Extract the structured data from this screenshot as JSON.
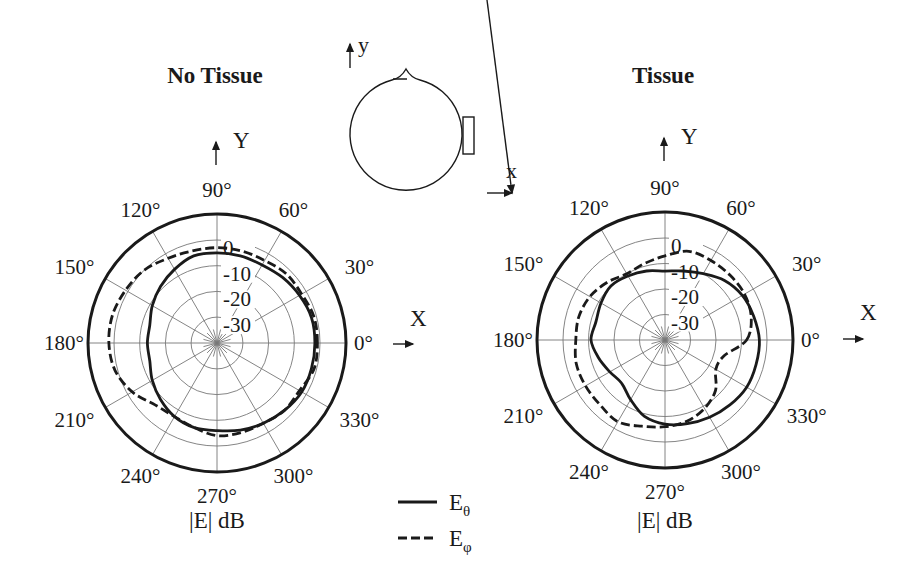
{
  "figure": {
    "head_diagram": {
      "y_axis_label": "y",
      "x_axis_label": "x"
    },
    "legend": [
      {
        "label": "E",
        "subscript": "θ",
        "style": "solid"
      },
      {
        "label": "E",
        "subscript": "φ",
        "style": "dashed"
      }
    ]
  },
  "chart_data": [
    {
      "type": "polar",
      "title": "No Tissue",
      "axis_x_label": "X",
      "axis_y_label": "Y",
      "radial_label": "|E| dB",
      "angle_ticks": [
        "0°",
        "30°",
        "60°",
        "90°",
        "120°",
        "150°",
        "180°",
        "210°",
        "240°",
        "270°",
        "300°",
        "330°"
      ],
      "radial_ticks": [
        "0",
        "-10",
        "-20",
        "-30"
      ],
      "radial_range_db": [
        -40,
        10
      ],
      "angles_deg": [
        0,
        15,
        30,
        45,
        60,
        75,
        90,
        105,
        120,
        135,
        150,
        165,
        180,
        195,
        210,
        225,
        240,
        255,
        270,
        285,
        300,
        315,
        330,
        345
      ],
      "series": [
        {
          "name": "Eθ",
          "style": "solid",
          "values_db": [
            -2,
            -2,
            -3,
            -4,
            -5,
            -5,
            -5,
            -5,
            -7,
            -9,
            -11,
            -13,
            -13,
            -13,
            -11,
            -9,
            -7,
            -6,
            -6,
            -5,
            -4,
            -3,
            -2,
            -2
          ]
        },
        {
          "name": "Eφ",
          "style": "dashed",
          "values_db": [
            -1,
            -1,
            -2,
            -2,
            -3,
            -3,
            -3,
            -3,
            -2,
            0,
            1,
            2,
            2,
            1,
            -2,
            -6,
            -7,
            -6,
            -4,
            -4,
            -4,
            -3,
            -3,
            -1
          ]
        }
      ]
    },
    {
      "type": "polar",
      "title": "Tissue",
      "axis_x_label": "X",
      "axis_y_label": "Y",
      "radial_label": "|E| dB",
      "angle_ticks": [
        "0°",
        "30°",
        "60°",
        "90°",
        "120°",
        "150°",
        "180°",
        "210°",
        "240°",
        "270°",
        "300°",
        "330°"
      ],
      "radial_ticks": [
        "0",
        "-10",
        "-20",
        "-30"
      ],
      "radial_range_db": [
        -40,
        10
      ],
      "angles_deg": [
        0,
        15,
        30,
        45,
        60,
        75,
        90,
        105,
        120,
        135,
        150,
        165,
        180,
        195,
        210,
        225,
        240,
        255,
        270,
        285,
        300,
        315,
        330,
        345
      ],
      "series": [
        {
          "name": "Eθ",
          "style": "solid",
          "values_db": [
            -3,
            -4,
            -5,
            -7,
            -10,
            -12,
            -13,
            -12,
            -11,
            -10,
            -11,
            -12,
            -11,
            -13,
            -15,
            -16,
            -13,
            -9,
            -7,
            -6,
            -5,
            -4,
            -3,
            -3
          ]
        },
        {
          "name": "Eφ",
          "style": "dashed",
          "values_db": [
            -8,
            -5,
            -4,
            -4,
            -4,
            -4,
            -7,
            -9,
            -10,
            -8,
            -6,
            -5,
            -5,
            -4,
            -4,
            -4,
            -3,
            -5,
            -6,
            -7,
            -9,
            -12,
            -17,
            -16
          ]
        }
      ]
    }
  ]
}
